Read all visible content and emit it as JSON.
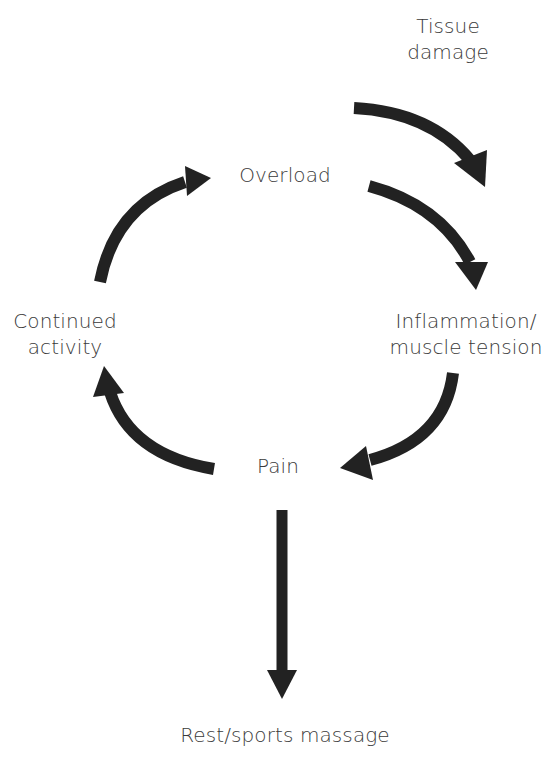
{
  "diagram": {
    "type": "cycle",
    "colors": {
      "arrow": "#222222",
      "text": "#3a3a3a",
      "background": "#ffffff"
    },
    "nodes": {
      "tissue_damage": {
        "line1": "Tissue",
        "line2": "damage"
      },
      "overload": {
        "label": "Overload"
      },
      "continued_activity": {
        "line1": "Continued",
        "line2": "activity"
      },
      "inflammation": {
        "line1": "Inflammation/",
        "line2": "muscle tension"
      },
      "pain": {
        "label": "Pain"
      },
      "rest": {
        "label": "Rest/sports massage"
      }
    },
    "edges": [
      {
        "from": "Tissue damage",
        "to": "Inflammation/muscle tension"
      },
      {
        "from": "Overload",
        "to": "Inflammation/muscle tension"
      },
      {
        "from": "Inflammation/muscle tension",
        "to": "Pain"
      },
      {
        "from": "Pain",
        "to": "Continued activity"
      },
      {
        "from": "Continued activity",
        "to": "Overload"
      },
      {
        "from": "Pain",
        "to": "Rest/sports massage"
      }
    ]
  }
}
